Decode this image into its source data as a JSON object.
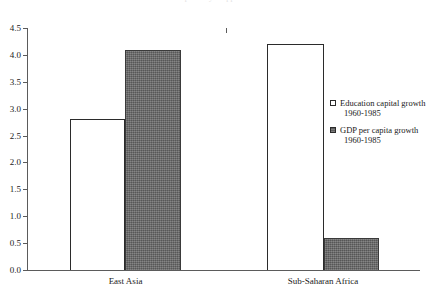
{
  "chart_data": {
    "type": "bar",
    "title": "",
    "xlabel": "",
    "ylabel": "",
    "ylim": [
      0.0,
      4.5
    ],
    "yticks": [
      "0.0",
      "0.5",
      "1.0",
      "1.5",
      "2.0",
      "2.5",
      "3.0",
      "3.5",
      "4.0",
      "4.5"
    ],
    "grid": false,
    "legend_position": "right",
    "categories": [
      "East Asia",
      "Sub-Saharan Africa"
    ],
    "series": [
      {
        "name": "Education capital growth",
        "subtitle": "1960-1985",
        "style": "open",
        "color": "#ffffff",
        "values": [
          2.8,
          4.2
        ]
      },
      {
        "name": "GDP per capita growth",
        "subtitle": "1960-1985",
        "style": "filled",
        "color": "#6a6a6a",
        "values": [
          4.1,
          0.6
        ]
      }
    ]
  },
  "legend": {
    "items": [
      {
        "label": "Education capital growth",
        "sub": "1960-1985",
        "swatch": "open-square-icon"
      },
      {
        "label": "GDP per capita growth",
        "sub": "1960-1985",
        "swatch": "filled-square-icon"
      }
    ]
  },
  "axis": {
    "y_labels": [
      "4.5",
      "4.0",
      "3.5",
      "3.0",
      "2.5",
      "2.0",
      "1.5",
      "1.0",
      "0.5",
      "0.0"
    ],
    "x_labels": [
      "East Asia",
      "Sub-Saharan Africa"
    ]
  },
  "title_sliver": "partially cropped title"
}
